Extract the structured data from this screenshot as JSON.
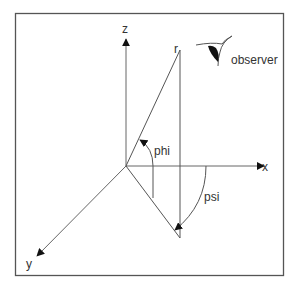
{
  "figure": {
    "type": "spherical-coordinates-diagram",
    "colors": {
      "line": "#555555",
      "frame": "#555555",
      "arrow": "#111111",
      "text": "#333333",
      "background": "#ffffff"
    }
  },
  "axes": {
    "x": {
      "label": "x"
    },
    "y": {
      "label": "y"
    },
    "z": {
      "label": "z"
    }
  },
  "point": {
    "label": "r"
  },
  "angles": {
    "phi": {
      "label": "phi"
    },
    "psi": {
      "label": "psi"
    }
  },
  "observer": {
    "label": "observer",
    "icon": "eye-icon"
  }
}
